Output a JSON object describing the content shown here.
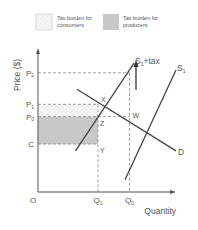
{
  "legend": {
    "items": [
      {
        "label_line1": "Tax burden for",
        "label_line2": "consumers",
        "fill": "#f4f4f4",
        "hatched": true
      },
      {
        "label_line1": "Tax burden for",
        "label_line2": "producers",
        "fill": "#c8c8c8",
        "hatched": false
      }
    ]
  },
  "chart_data": {
    "type": "line",
    "title": "",
    "xlabel": "Quantity",
    "ylabel": "Price ($)",
    "origin_label": "O",
    "xlim": [
      0,
      10
    ],
    "ylim": [
      0,
      10
    ],
    "price_levels": [
      {
        "name": "P2",
        "label": "P",
        "sub": "2",
        "value": 8.7
      },
      {
        "name": "P1",
        "label": "P",
        "sub": "1",
        "value": 6.4
      },
      {
        "name": "P0",
        "label": "P",
        "sub": "0",
        "value": 5.5
      },
      {
        "name": "C",
        "label": "C",
        "sub": "",
        "value": 3.5
      }
    ],
    "quantity_levels": [
      {
        "name": "Q1",
        "label": "Q",
        "sub": "1",
        "value": 4.0
      },
      {
        "name": "Q0",
        "label": "Q",
        "sub": "0",
        "value": 6.1
      }
    ],
    "series": [
      {
        "name": "D",
        "label": "D",
        "points": [
          [
            2.6,
            7.5
          ],
          [
            9.2,
            3.0
          ]
        ]
      },
      {
        "name": "S1",
        "label": "S",
        "sub": "1",
        "points": [
          [
            5.8,
            0.9
          ],
          [
            9.2,
            8.9
          ]
        ]
      },
      {
        "name": "S1+tax",
        "label": "S",
        "sub": "1",
        "suffix": "+tax",
        "points": [
          [
            2.5,
            3.0
          ],
          [
            6.4,
            9.4
          ]
        ]
      }
    ],
    "points": [
      {
        "name": "X",
        "x": 4.0,
        "y": 6.4
      },
      {
        "name": "W",
        "x": 6.1,
        "y": 5.5
      },
      {
        "name": "Z",
        "x": 4.0,
        "y": 5.5
      },
      {
        "name": "Y",
        "x": 4.0,
        "y": 3.5
      }
    ],
    "shaded_regions": [
      {
        "name": "consumer-burden",
        "x": [
          0,
          4.0
        ],
        "y": [
          5.5,
          6.4
        ]
      },
      {
        "name": "producer-burden",
        "x": [
          0,
          4.0
        ],
        "y": [
          3.5,
          5.5
        ]
      }
    ],
    "annotation": "upward arrow indicating supply shift from S1 to S1+tax"
  }
}
